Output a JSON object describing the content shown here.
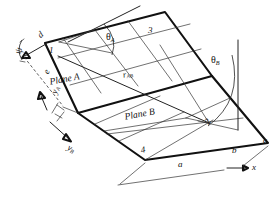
{
  "figure": {
    "background_color": "#ffffff",
    "line_color": "#111111"
  },
  "labels": {
    "plane_a": "Plane A",
    "plane_b": "Plane B",
    "node_1": "1",
    "node_2": "2",
    "node_3": "3",
    "node_4": "4",
    "point_a": "a",
    "point_b": "b",
    "point_c": "c",
    "point_d": "d",
    "point_e": "e",
    "theta_a_sym": "θ",
    "theta_a_sub": "A",
    "theta_b_sym": "θ",
    "theta_b_sub": "B",
    "r_ab_sym": "r",
    "r_ab_sub": "AB",
    "axis_x": "x",
    "axis_ya_sym": "y",
    "axis_ya_sub": "A",
    "axis_yb_sym": "y",
    "axis_yb_sub": "B",
    "psi": "ψ"
  },
  "annotations": {
    "angle_theta_a": "θA",
    "angle_theta_b": "θB",
    "distance_r_ab": "rAB"
  }
}
